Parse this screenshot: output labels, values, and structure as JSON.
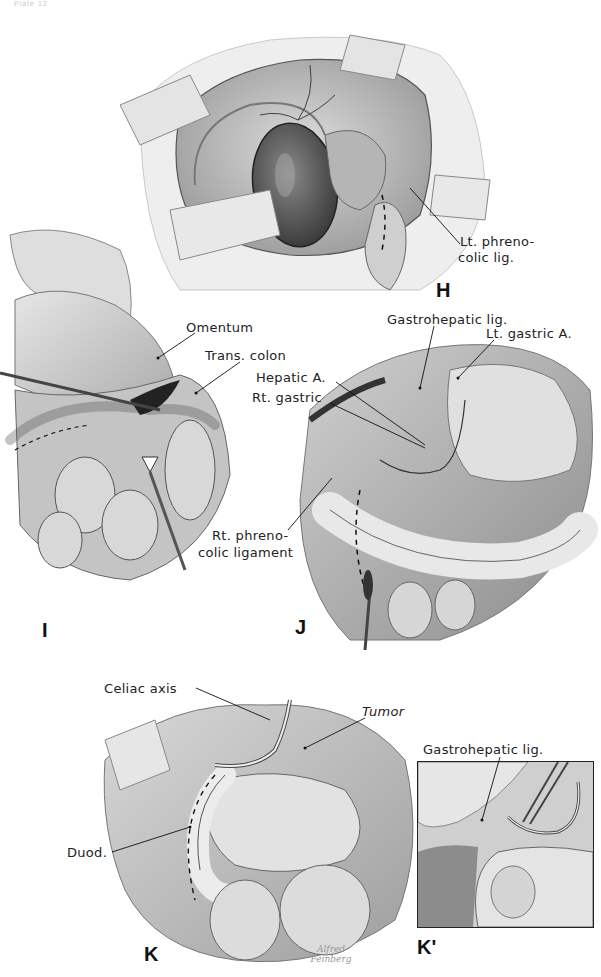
{
  "page": {
    "header_fragment": "Plate 12",
    "background": "#ffffff",
    "ink_color": "#1a1a1a"
  },
  "figures": {
    "H": {
      "letter": "H",
      "labels": [
        {
          "id": "lt-phrenocolic",
          "lines": [
            "Lt. phreno-",
            "colic lig."
          ]
        }
      ]
    },
    "I": {
      "letter": "I",
      "labels": [
        {
          "id": "omentum",
          "text": "Omentum"
        },
        {
          "id": "trans-colon",
          "text": "Trans. colon"
        }
      ]
    },
    "J": {
      "letter": "J",
      "labels": [
        {
          "id": "gastrohepatic-lig",
          "text": "Gastrohepatic lig."
        },
        {
          "id": "lt-gastric-a",
          "text": "Lt. gastric A."
        },
        {
          "id": "hepatic-a",
          "text": "Hepatic A."
        },
        {
          "id": "rt-gastric",
          "text": "Rt. gastric"
        },
        {
          "id": "rt-phrenocolic",
          "lines": [
            "Rt. phreno-",
            "colic ligament"
          ]
        }
      ]
    },
    "K": {
      "letter": "K",
      "labels": [
        {
          "id": "celiac-axis",
          "text": "Celiac axis"
        },
        {
          "id": "tumor",
          "text": "Tumor"
        },
        {
          "id": "duod",
          "text": "Duod."
        }
      ],
      "signature": [
        "Alfred",
        "Feinberg"
      ]
    },
    "K_prime": {
      "letter": "K'",
      "labels": [
        {
          "id": "gastrohepatic-lig-kp",
          "text": "Gastrohepatic lig."
        }
      ]
    }
  }
}
